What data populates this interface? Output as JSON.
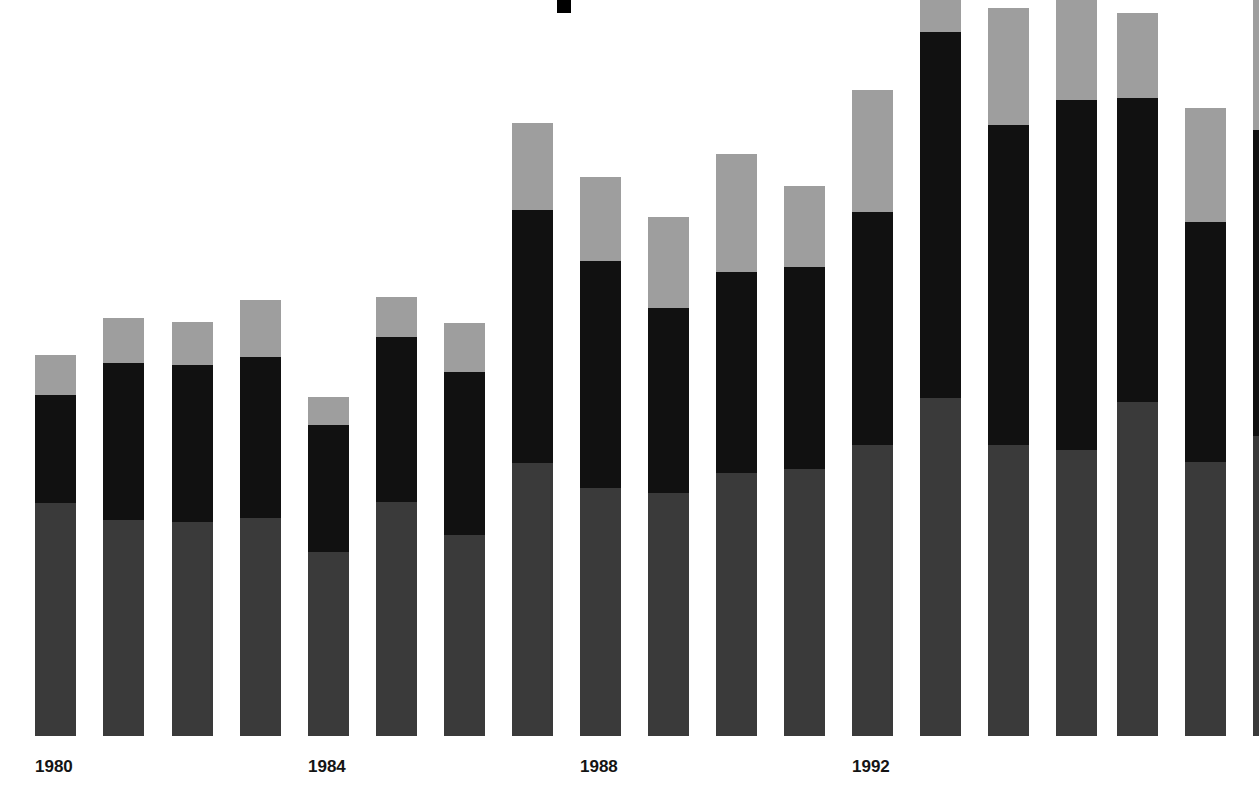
{
  "chart_data": {
    "type": "bar",
    "title": "",
    "subtitle": "",
    "xlabel": "",
    "ylabel": "",
    "stacked": true,
    "grid": false,
    "legend_position": "none",
    "axis": {
      "baseline_px": 736,
      "top_px": 0,
      "value_unit": "pixel-height",
      "note": "Chart is cropped at top and right edge; tallest bars are clipped."
    },
    "categories": [
      "1980",
      "1981",
      "1982",
      "1983",
      "1984",
      "1985",
      "1986",
      "1987",
      "1988",
      "1989",
      "1990",
      "1991",
      "1992",
      "1993",
      "1994",
      "1995",
      "1996",
      "1997",
      "1998"
    ],
    "tick_labels": [
      {
        "label": "1980",
        "category_index": 0
      },
      {
        "label": "1984",
        "category_index": 4
      },
      {
        "label": "1988",
        "category_index": 8
      },
      {
        "label": "1992",
        "category_index": 12
      }
    ],
    "series": [
      {
        "name": "bottom-segment",
        "color": "#3a3a3a",
        "values": [
          233,
          216,
          214,
          218,
          184,
          234,
          201,
          273,
          248,
          243,
          263,
          267,
          291,
          338,
          291,
          286,
          334,
          274,
          300
        ]
      },
      {
        "name": "middle-segment",
        "color": "#111111",
        "values": [
          108,
          157,
          157,
          161,
          127,
          165,
          163,
          253,
          227,
          185,
          201,
          202,
          233,
          366,
          320,
          350,
          304,
          240,
          290
        ]
      },
      {
        "name": "top-segment",
        "color": "#9e9e9e",
        "values": [
          40,
          45,
          43,
          57,
          28,
          40,
          49,
          87,
          84,
          91,
          118,
          81,
          122,
          32,
          117,
          100,
          85,
          114,
          130
        ]
      }
    ],
    "totals": [
      381,
      418,
      414,
      436,
      339,
      439,
      413,
      613,
      559,
      519,
      582,
      550,
      646,
      736,
      728,
      736,
      723,
      628,
      720
    ],
    "bars": [
      {
        "category": "1980",
        "x": 35,
        "width": 41,
        "top": 355,
        "break_light_dark": 395,
        "break_dark_mid": 503,
        "bottom": 736,
        "clipped_top": false
      },
      {
        "category": "1981",
        "x": 103,
        "width": 41,
        "top": 318,
        "break_light_dark": 363,
        "break_dark_mid": 520,
        "bottom": 736,
        "clipped_top": false
      },
      {
        "category": "1982",
        "x": 172,
        "width": 41,
        "top": 322,
        "break_light_dark": 365,
        "break_dark_mid": 522,
        "bottom": 736,
        "clipped_top": false
      },
      {
        "category": "1983",
        "x": 240,
        "width": 41,
        "top": 300,
        "break_light_dark": 357,
        "break_dark_mid": 518,
        "bottom": 736,
        "clipped_top": false
      },
      {
        "category": "1984",
        "x": 308,
        "width": 41,
        "top": 397,
        "break_light_dark": 425,
        "break_dark_mid": 552,
        "bottom": 736,
        "clipped_top": false
      },
      {
        "category": "1985",
        "x": 376,
        "width": 41,
        "top": 297,
        "break_light_dark": 337,
        "break_dark_mid": 502,
        "bottom": 736,
        "clipped_top": false
      },
      {
        "category": "1986",
        "x": 444,
        "width": 41,
        "top": 323,
        "break_light_dark": 372,
        "break_dark_mid": 535,
        "bottom": 736,
        "clipped_top": false
      },
      {
        "category": "1987",
        "x": 512,
        "width": 41,
        "top": 123,
        "break_light_dark": 210,
        "break_dark_mid": 463,
        "bottom": 736,
        "clipped_top": false
      },
      {
        "category": "1988",
        "x": 580,
        "width": 41,
        "top": 177,
        "break_light_dark": 261,
        "break_dark_mid": 488,
        "bottom": 736,
        "clipped_top": false
      },
      {
        "category": "1989",
        "x": 648,
        "width": 41,
        "top": 217,
        "break_light_dark": 308,
        "break_dark_mid": 493,
        "bottom": 736,
        "clipped_top": false
      },
      {
        "category": "1990",
        "x": 716,
        "width": 41,
        "top": 154,
        "break_light_dark": 272,
        "break_dark_mid": 473,
        "bottom": 736,
        "clipped_top": false
      },
      {
        "category": "1991",
        "x": 784,
        "width": 41,
        "top": 186,
        "break_light_dark": 267,
        "break_dark_mid": 469,
        "bottom": 736,
        "clipped_top": false
      },
      {
        "category": "1992",
        "x": 852,
        "width": 41,
        "top": 90,
        "break_light_dark": 212,
        "break_dark_mid": 445,
        "bottom": 736,
        "clipped_top": false
      },
      {
        "category": "1993",
        "x": 920,
        "width": 41,
        "top": -32,
        "break_light_dark": 32,
        "break_dark_mid": 398,
        "bottom": 736,
        "clipped_top": true
      },
      {
        "category": "1994",
        "x": 988,
        "width": 41,
        "top": 8,
        "break_light_dark": 125,
        "break_dark_mid": 445,
        "bottom": 736,
        "clipped_top": false
      },
      {
        "category": "1995",
        "x": 1056,
        "width": 41,
        "top": -14,
        "break_light_dark": 100,
        "break_dark_mid": 450,
        "bottom": 736,
        "clipped_top": true
      },
      {
        "category": "1996",
        "x": 1117,
        "width": 41,
        "top": 13,
        "break_light_dark": 98,
        "break_dark_mid": 402,
        "bottom": 736,
        "clipped_top": false
      },
      {
        "category": "1997",
        "x": 1185,
        "width": 41,
        "top": 108,
        "break_light_dark": 222,
        "break_dark_mid": 462,
        "bottom": 736,
        "clipped_top": false
      },
      {
        "category": "1998",
        "x": 1253,
        "width": 41,
        "top": -16,
        "break_light_dark": 130,
        "break_dark_mid": 436,
        "bottom": 736,
        "clipped_top": true,
        "clipped_right": true
      }
    ],
    "marker": {
      "name": "top-center-square",
      "color": "#000000",
      "x": 557,
      "y": 0,
      "width": 14,
      "height": 13
    },
    "colors": {
      "background": "#ffffff",
      "segment_top": "#9e9e9e",
      "segment_middle": "#111111",
      "segment_bottom": "#3a3a3a",
      "label_text": "#141414"
    }
  }
}
